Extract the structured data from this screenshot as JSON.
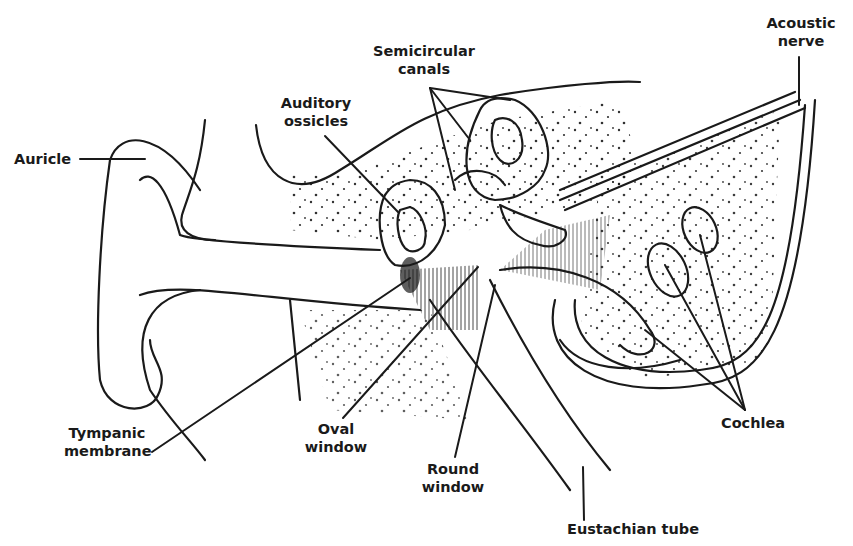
{
  "diagram": {
    "labels": {
      "auricle": "Auricle",
      "auditory_ossicles": [
        "Auditory",
        "ossicles"
      ],
      "semicircular_canals": [
        "Semicircular",
        "canals"
      ],
      "acoustic_nerve": [
        "Acoustic",
        "nerve"
      ],
      "tympanic_membrane": [
        "Tympanic",
        "membrane"
      ],
      "oval_window": [
        "Oval",
        "window"
      ],
      "round_window": [
        "Round",
        "window"
      ],
      "eustachian_tube": "Eustachian tube",
      "cochlea": "Cochlea"
    },
    "colors": {
      "ink": "#1a1a1a",
      "background": "#ffffff"
    }
  }
}
